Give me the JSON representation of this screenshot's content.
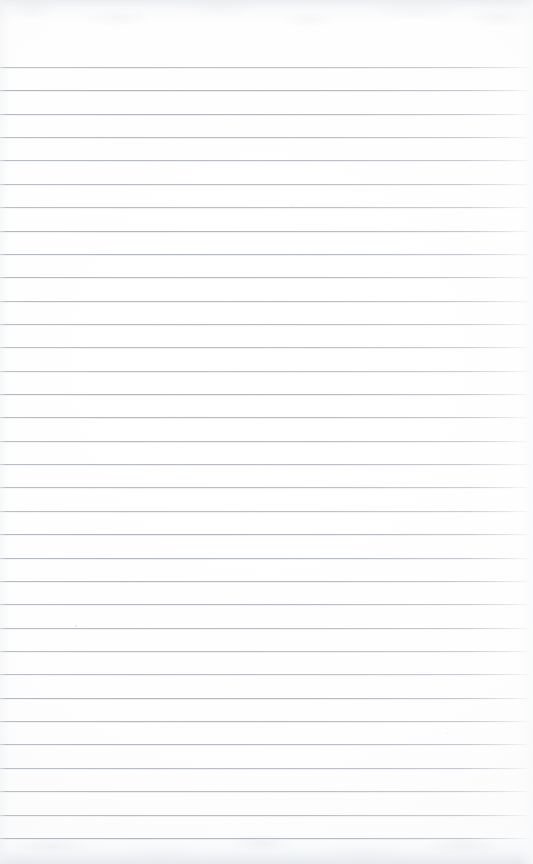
{
  "document": {
    "kind": "scanned-ruled-paper",
    "title": "Blank Ruled Notepad Page",
    "content_text": "",
    "handwriting_present": "none",
    "printed_text_present": "none"
  },
  "page": {
    "width_px": 533,
    "height_px": 864,
    "background_color": "#fdfdfd",
    "paper_tone": "#ffffff"
  },
  "ruling": {
    "line_color": "#b6bbc1",
    "line_thickness_px": 1,
    "line_count": 34,
    "first_line_y_px": 67,
    "last_line_y_px": 838,
    "line_spacing_px": 23.36,
    "left_margin_px": 0,
    "right_end_px": 530,
    "margin_rule_present": "none",
    "top_blank_margin_px": 67,
    "bottom_blank_margin_px": 26
  },
  "scan_artifacts": {
    "top_edge_shadow": "#e9ecef",
    "bottom_edge_shadow": "#e6e9ed",
    "grain_present": "yes",
    "specks": [
      {
        "x_px": 75,
        "y_px": 625,
        "size_px": 2
      },
      {
        "x_px": 292,
        "y_px": 206,
        "size_px": 1
      },
      {
        "x_px": 447,
        "y_px": 733,
        "size_px": 1
      }
    ]
  }
}
